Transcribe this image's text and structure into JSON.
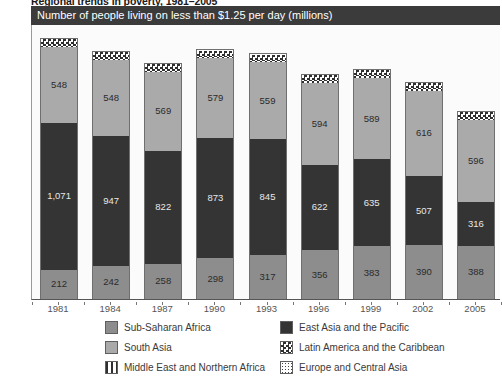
{
  "suptitle": "Regional trends in poverty, 1981–2005",
  "banner_title": "Number of people living on less than $1.25 per day (millions)",
  "yaxis": {
    "ticks": [
      "2,000",
      "1,600",
      "1,200",
      "800",
      "400",
      "0"
    ],
    "min": 0,
    "max": 2000
  },
  "legend": {
    "items": [
      {
        "label": "Sub-Saharan Africa",
        "pattern": "solid-medium-gray",
        "color": "#8d8d8d"
      },
      {
        "label": "East Asia and the Pacific",
        "pattern": "solid-dark",
        "color": "#343434"
      },
      {
        "label": "South Asia",
        "pattern": "solid-light-gray",
        "color": "#aaaaaa"
      },
      {
        "label": "Latin America and the Caribbean",
        "pattern": "checkerboard",
        "color": "#2f2f2f"
      },
      {
        "label": "Middle East and Northern Africa",
        "pattern": "vertical-stripes",
        "color": "#2f2f2f"
      },
      {
        "label": "Europe and Central Asia",
        "pattern": "dotted",
        "color": "#444444"
      }
    ]
  },
  "chart_data": {
    "type": "bar",
    "title": "Number of people living on less than $1.25 per day (millions)",
    "subtitle": "Regional trends in poverty, 1981–2005",
    "xlabel": "",
    "ylabel": "",
    "ylim": [
      0,
      2000
    ],
    "yticks": [
      0,
      400,
      800,
      1200,
      1600,
      2000
    ],
    "grid": false,
    "stacked": true,
    "legend_position": "bottom",
    "categories": [
      "1981",
      "1984",
      "1987",
      "1990",
      "1993",
      "1996",
      "1999",
      "2002",
      "2005"
    ],
    "series": [
      {
        "name": "Sub-Saharan Africa",
        "values": [
          212,
          242,
          258,
          298,
          317,
          356,
          383,
          390,
          388
        ]
      },
      {
        "name": "East Asia and the Pacific",
        "values": [
          1071,
          947,
          822,
          873,
          845,
          622,
          635,
          507,
          316
        ]
      },
      {
        "name": "South Asia",
        "values": [
          548,
          548,
          569,
          579,
          559,
          594,
          589,
          616,
          596
        ]
      },
      {
        "name": "Middle East and Northern Africa",
        "values": [
          12,
          12,
          12,
          12,
          12,
          12,
          12,
          12,
          12
        ]
      },
      {
        "name": "Latin America and the Caribbean",
        "values": [
          45,
          45,
          45,
          45,
          45,
          45,
          45,
          45,
          45
        ]
      },
      {
        "name": "Europe and Central Asia",
        "values": [
          10,
          10,
          10,
          10,
          10,
          10,
          10,
          10,
          10
        ]
      }
    ],
    "totals": [
      1898,
      1804,
      1716,
      1807,
      1788,
      1639,
      1694,
      1570,
      1367
    ],
    "bar_labels": [
      {
        "category": "1981",
        "south_asia": "548",
        "east_asia": "1,071",
        "sub_saharan": "212"
      },
      {
        "category": "1984",
        "south_asia": "548",
        "east_asia": "947",
        "sub_saharan": "242"
      },
      {
        "category": "1987",
        "south_asia": "569",
        "east_asia": "822",
        "sub_saharan": "258"
      },
      {
        "category": "1990",
        "south_asia": "579",
        "east_asia": "873",
        "sub_saharan": "298"
      },
      {
        "category": "1993",
        "south_asia": "559",
        "east_asia": "845",
        "sub_saharan": "317"
      },
      {
        "category": "1996",
        "south_asia": "594",
        "east_asia": "622",
        "sub_saharan": "356"
      },
      {
        "category": "1999",
        "south_asia": "589",
        "east_asia": "635",
        "sub_saharan": "383"
      },
      {
        "category": "2002",
        "south_asia": "616",
        "east_asia": "507",
        "sub_saharan": "390"
      },
      {
        "category": "2005",
        "south_asia": "596",
        "east_asia": "316",
        "sub_saharan": "388"
      }
    ]
  }
}
